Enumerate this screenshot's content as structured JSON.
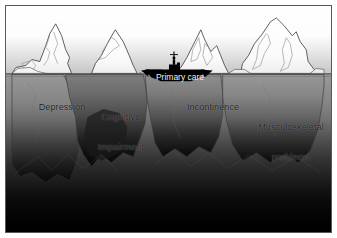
{
  "figure": {
    "type": "iceberg-diagram",
    "background_colors": {
      "sky_top": "#ffffff",
      "sky_horizon": "#c9c9c9",
      "water_top": "#8e8e8e",
      "water_bottom": "#050505",
      "iceberg_above_water": "#fdfdfd",
      "iceberg_outline": "#3a3a3a",
      "ship_fill": "#000000",
      "frame_border": "#59595a",
      "label_text": "#1a1a1a",
      "ship_label_text": "#f2f2f2"
    },
    "waterline_y_fraction": 0.3
  },
  "icebergs": [
    {
      "id": "depression",
      "label": "Depression",
      "label_lines": [
        "Depression"
      ],
      "order": 1
    },
    {
      "id": "cognitive-impairment",
      "label": "Cognitive Impairment",
      "label_lines": [
        "Cognitive",
        "Impairment"
      ],
      "order": 2
    },
    {
      "id": "incontinence",
      "label": "Incontinence",
      "label_lines": [
        "Incontinence"
      ],
      "order": 3
    },
    {
      "id": "musculoskeletal-problems",
      "label": "Musculoskeletal problems",
      "label_lines": [
        "Musculoskeletal",
        "problems"
      ],
      "order": 4
    }
  ],
  "ship": {
    "label": "Primary care",
    "icon": "ship-icon",
    "figure_icon": "person-on-deck-icon"
  },
  "labels": {
    "depression": "Depression",
    "cognitive_line1": "Cognitive",
    "cognitive_line2": "Impairment",
    "incontinence": "Incontinence",
    "musculo_line1": "Musculoskeletal",
    "musculo_line2": "problems",
    "primary_care": "Primary care"
  }
}
